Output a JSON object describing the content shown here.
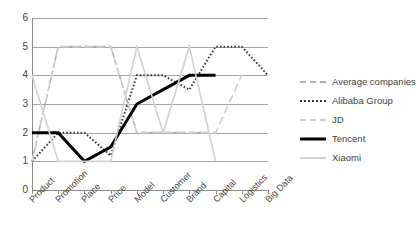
{
  "chart_data": {
    "type": "line",
    "title": "",
    "xlabel": "",
    "ylabel": "",
    "ylim": [
      0,
      6
    ],
    "ytick_step": 1,
    "grid": true,
    "legend_position": "right",
    "categories": [
      "Product",
      "Promotion",
      "Place",
      "Price",
      "Model",
      "Customer",
      "Brand",
      "Capital",
      "Logistics",
      "Big Data"
    ],
    "ytick_labels": [
      "0",
      "1",
      "2",
      "3",
      "4",
      "5",
      "6"
    ],
    "series": [
      {
        "name": "Average companies",
        "style": "dashed",
        "color": "#b0b0b0",
        "values": [
          1,
          5,
          5,
          5,
          2,
          2,
          2,
          2,
          null,
          null
        ]
      },
      {
        "name": "Alibaba Group",
        "style": "dotted",
        "color": "#3a3a3a",
        "values": [
          1,
          2,
          2,
          1.2,
          4,
          4,
          3.5,
          5,
          5,
          4
        ]
      },
      {
        "name": "JD",
        "style": "long-dashed",
        "color": "#cfcfcf",
        "values": [
          1,
          5,
          5,
          5,
          2,
          2,
          2,
          2,
          4,
          null
        ]
      },
      {
        "name": "Tencent",
        "style": "solid-thick",
        "color": "#000000",
        "values": [
          2,
          2,
          1,
          1.5,
          3,
          3.5,
          4,
          4,
          null,
          null
        ]
      },
      {
        "name": "Xiaomi",
        "style": "solid",
        "color": "#d2d2d2",
        "values": [
          4,
          1,
          1,
          1,
          5,
          2,
          5,
          1,
          null,
          null
        ]
      }
    ]
  },
  "legend": {
    "items": [
      {
        "label": "Average companies"
      },
      {
        "label": "Alibaba Group"
      },
      {
        "label": "JD"
      },
      {
        "label": "Tencent"
      },
      {
        "label": "Xiaomi"
      }
    ]
  }
}
